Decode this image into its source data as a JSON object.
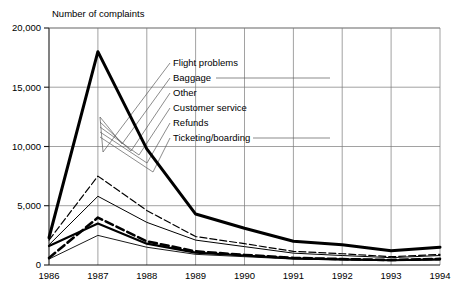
{
  "figure": {
    "axis_title": "Number of complaints",
    "y_ticks": [
      "0",
      "5,000",
      "10,000",
      "15,000",
      "20,000"
    ],
    "x_ticks": [
      "1986",
      "1987",
      "1988",
      "1989",
      "1990",
      "1991",
      "1992",
      "1993",
      "1994"
    ],
    "legend": [
      {
        "label": "Flight problems"
      },
      {
        "label": "Baggage"
      },
      {
        "label": "Other"
      },
      {
        "label": "Customer service"
      },
      {
        "label": "Refunds"
      },
      {
        "label": "Ticketing/boarding"
      }
    ]
  },
  "chart_data": {
    "type": "line",
    "title": "Number of complaints",
    "xlabel": "",
    "ylabel": "Number of complaints",
    "x": [
      1986,
      1987,
      1988,
      1989,
      1990,
      1991,
      1992,
      1993,
      1994
    ],
    "categories": [
      "1986",
      "1987",
      "1988",
      "1989",
      "1990",
      "1991",
      "1992",
      "1993",
      "1994"
    ],
    "ylim": [
      0,
      20000
    ],
    "xlim": [
      1986,
      1994
    ],
    "yticks": [
      0,
      5000,
      10000,
      15000,
      20000
    ],
    "ytick_labels": [
      "0",
      "5,000",
      "10,000",
      "15,000",
      "20,000"
    ],
    "grid": true,
    "legend_position": "inside-upper-right-with-leader-lines",
    "series": [
      {
        "name": "Flight problems",
        "style": "thick-solid",
        "values": [
          2300,
          18000,
          9800,
          4300,
          3100,
          2000,
          1700,
          1200,
          1500
        ]
      },
      {
        "name": "Baggage",
        "style": "thin-dashed",
        "values": [
          2100,
          7500,
          4600,
          2400,
          1800,
          1150,
          950,
          700,
          900
        ]
      },
      {
        "name": "Other",
        "style": "thin-solid",
        "values": [
          1700,
          5800,
          3600,
          2100,
          1550,
          1000,
          800,
          620,
          800
        ]
      },
      {
        "name": "Customer service",
        "style": "thick-dashed",
        "values": [
          600,
          4000,
          2000,
          1150,
          850,
          600,
          500,
          420,
          520
        ]
      },
      {
        "name": "Refunds",
        "style": "thick-solid-thin",
        "values": [
          1600,
          3500,
          1800,
          1050,
          800,
          560,
          470,
          400,
          480
        ]
      },
      {
        "name": "Ticketing/boarding",
        "style": "hairline-solid",
        "values": [
          500,
          2500,
          1500,
          900,
          700,
          500,
          430,
          370,
          440
        ]
      }
    ]
  }
}
